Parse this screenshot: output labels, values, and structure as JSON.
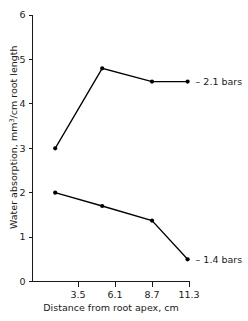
{
  "chart_data": {
    "type": "line",
    "title": "",
    "xlabel": "Distance from root apex, cm",
    "ylabel": "Water absorption, mm3/cm root length",
    "ylabel_prefix": "Water absorption, mm",
    "ylabel_superscript": "3",
    "ylabel_suffix": "/cm root length",
    "xlim": [
      0.6,
      12.6
    ],
    "ylim": [
      0,
      6
    ],
    "xticks": [
      3.5,
      6.1,
      8.7,
      11.3
    ],
    "xtick_labels": [
      "3.5",
      "6.1",
      "8.7",
      "11.3"
    ],
    "yticks": [
      0,
      1,
      2,
      3,
      4,
      5,
      6
    ],
    "ytick_labels": [
      "0",
      "1",
      "2",
      "3",
      "4",
      "5",
      "6"
    ],
    "grid": false,
    "legend_position": "inline-right",
    "marker": "filled-circle",
    "series": [
      {
        "name": "– 2.1 bars",
        "label": "– 2.1 bars",
        "x": [
          1.9,
          5.2,
          8.7,
          11.2
        ],
        "values": [
          3.0,
          4.8,
          4.5,
          4.5
        ]
      },
      {
        "name": "– 1.4 bars",
        "label": "– 1.4 bars",
        "x": [
          1.9,
          5.2,
          8.7,
          11.2
        ],
        "values": [
          2.0,
          1.7,
          1.37,
          0.5
        ]
      }
    ]
  },
  "axis_labels": {
    "x_title": "Distance from root apex, cm"
  }
}
